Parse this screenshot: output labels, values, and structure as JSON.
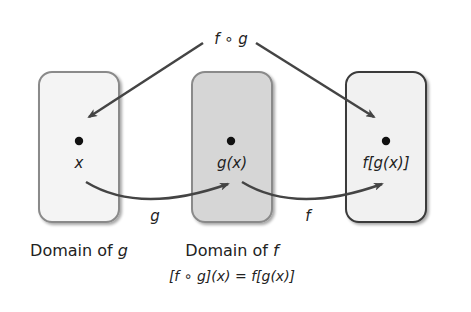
{
  "title_label": "f ∘ g",
  "boxes": [
    {
      "id": "domain-g",
      "point_label": "x",
      "caption": "Domain of ",
      "caption_var": "g",
      "fill": "#f4f4f4",
      "stroke": "#8a8a8a"
    },
    {
      "id": "domain-f",
      "point_label": "g(x)",
      "caption": "Domain of ",
      "caption_var": "f",
      "fill": "#d6d6d6",
      "stroke": "#8a8a8a"
    },
    {
      "id": "range",
      "point_label": "f[g(x)]",
      "caption": "",
      "caption_var": "",
      "fill": "#f1f1f1",
      "stroke": "#3a3a3a"
    }
  ],
  "arrows": [
    {
      "label": "g",
      "from": "x",
      "to": "g(x)"
    },
    {
      "label": "f",
      "from": "g(x)",
      "to": "f[g(x)]"
    }
  ],
  "formula": "[f ∘ g](x) = f[g(x)]",
  "colors": {
    "arrow": "#444444",
    "text": "#222222"
  }
}
